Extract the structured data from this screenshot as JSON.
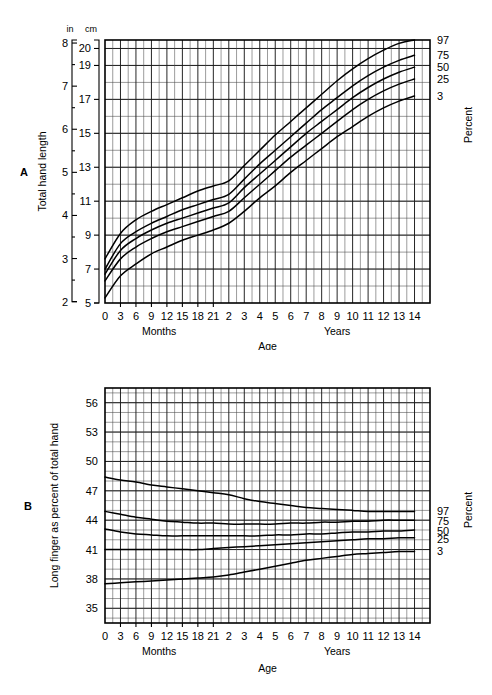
{
  "figure": {
    "panels": [
      {
        "letter": "A",
        "ylabel": "Total hand length",
        "xlabel": "Age",
        "x_group_labels": [
          "Months",
          "Years"
        ],
        "percent_label": "Percent",
        "unit_labels": [
          "in",
          "cm"
        ],
        "inch_ticks": [
          "8",
          "7",
          "6",
          "5",
          "4",
          "3",
          "2"
        ],
        "cm_ticks": [
          "20",
          "19",
          "17",
          "15",
          "13",
          "11",
          "9",
          "7",
          "5"
        ],
        "x_ticks": [
          "0",
          "3",
          "6",
          "9",
          "12",
          "15",
          "18",
          "21",
          "2",
          "3",
          "4",
          "5",
          "6",
          "7",
          "8",
          "9",
          "10",
          "11",
          "12",
          "13",
          "14"
        ],
        "percentiles": [
          "97",
          "75",
          "50",
          "25",
          "3"
        ]
      },
      {
        "letter": "B",
        "ylabel": "Long finger as percent of total hand",
        "xlabel": "Age",
        "x_group_labels": [
          "Months",
          "Years"
        ],
        "percent_label": "Percent",
        "y_ticks": [
          "56",
          "53",
          "50",
          "47",
          "44",
          "41",
          "38",
          "35"
        ],
        "x_ticks": [
          "0",
          "3",
          "6",
          "9",
          "12",
          "15",
          "18",
          "21",
          "2",
          "3",
          "4",
          "5",
          "6",
          "7",
          "8",
          "9",
          "10",
          "11",
          "12",
          "13",
          "14"
        ],
        "percentiles": [
          "97",
          "75",
          "50",
          "25",
          "3"
        ]
      }
    ]
  },
  "chart_data": [
    {
      "type": "line",
      "title": "A. Total hand length",
      "xlabel": "Age",
      "ylabel": "Total hand length",
      "y_unit_primary": "in",
      "y_unit_secondary": "cm",
      "ylim_cm": [
        5,
        20.5
      ],
      "ylim_in": [
        2,
        8.07
      ],
      "grid": true,
      "legend_position": "right",
      "x": [
        0,
        0.25,
        0.5,
        0.75,
        1,
        1.25,
        1.5,
        1.75,
        2,
        3,
        4,
        5,
        6,
        7,
        8,
        9,
        10,
        11,
        12,
        13,
        14
      ],
      "x_tick_labels": [
        "0",
        "3",
        "6",
        "9",
        "12",
        "15",
        "18",
        "21",
        "2",
        "3",
        "4",
        "5",
        "6",
        "7",
        "8",
        "9",
        "10",
        "11",
        "12",
        "13",
        "14"
      ],
      "x_units_note": "0-21 in months, 2-14 in years",
      "series": [
        {
          "name": "97",
          "values_cm": [
            7.6,
            9.1,
            9.9,
            10.4,
            10.8,
            11.2,
            11.6,
            11.9,
            12.2,
            13.1,
            14.0,
            14.9,
            15.7,
            16.5,
            17.3,
            18.1,
            18.8,
            19.4,
            19.9,
            20.3,
            20.5
          ]
        },
        {
          "name": "75",
          "values_cm": [
            7.0,
            8.5,
            9.2,
            9.7,
            10.1,
            10.5,
            10.8,
            11.1,
            11.4,
            12.3,
            13.2,
            14.0,
            14.8,
            15.6,
            16.4,
            17.1,
            17.8,
            18.4,
            18.9,
            19.3,
            19.6
          ]
        },
        {
          "name": "50",
          "values_cm": [
            6.7,
            8.1,
            8.8,
            9.3,
            9.7,
            10.0,
            10.3,
            10.6,
            10.9,
            11.8,
            12.6,
            13.4,
            14.2,
            15.0,
            15.7,
            16.4,
            17.1,
            17.7,
            18.2,
            18.6,
            18.9
          ]
        },
        {
          "name": "25",
          "values_cm": [
            6.3,
            7.6,
            8.3,
            8.8,
            9.2,
            9.5,
            9.8,
            10.1,
            10.4,
            11.2,
            12.0,
            12.8,
            13.6,
            14.3,
            15.0,
            15.7,
            16.4,
            17.0,
            17.5,
            17.9,
            18.2
          ]
        },
        {
          "name": "3",
          "values_cm": [
            5.3,
            6.6,
            7.3,
            7.9,
            8.3,
            8.7,
            9.0,
            9.3,
            9.7,
            10.4,
            11.2,
            11.9,
            12.7,
            13.4,
            14.1,
            14.8,
            15.4,
            16.0,
            16.5,
            16.9,
            17.2
          ]
        }
      ]
    },
    {
      "type": "line",
      "title": "B. Long finger as percent of total hand",
      "xlabel": "Age",
      "ylabel": "Long finger as percent of total hand",
      "ylim": [
        33.5,
        57.5
      ],
      "grid": true,
      "legend_position": "right",
      "x": [
        0,
        0.25,
        0.5,
        0.75,
        1,
        1.25,
        1.5,
        1.75,
        2,
        3,
        4,
        5,
        6,
        7,
        8,
        9,
        10,
        11,
        12,
        13,
        14
      ],
      "x_tick_labels": [
        "0",
        "3",
        "6",
        "9",
        "12",
        "15",
        "18",
        "21",
        "2",
        "3",
        "4",
        "5",
        "6",
        "7",
        "8",
        "9",
        "10",
        "11",
        "12",
        "13",
        "14"
      ],
      "x_units_note": "0-21 in months, 2-14 in years",
      "series": [
        {
          "name": "97",
          "values": [
            48.4,
            48.1,
            47.9,
            47.6,
            47.4,
            47.2,
            47.0,
            46.8,
            46.6,
            46.2,
            45.9,
            45.7,
            45.5,
            45.3,
            45.2,
            45.1,
            45.0,
            44.9,
            44.9,
            44.9,
            44.9
          ]
        },
        {
          "name": "75",
          "values": [
            44.9,
            44.6,
            44.3,
            44.1,
            43.9,
            43.8,
            43.7,
            43.7,
            43.6,
            43.6,
            43.6,
            43.6,
            43.7,
            43.7,
            43.8,
            43.8,
            43.9,
            43.9,
            44.0,
            44.0,
            44.0
          ]
        },
        {
          "name": "50",
          "values": [
            43.1,
            42.8,
            42.6,
            42.5,
            42.4,
            42.4,
            42.4,
            42.4,
            42.4,
            42.4,
            42.4,
            42.5,
            42.5,
            42.6,
            42.6,
            42.7,
            42.8,
            42.8,
            42.9,
            42.9,
            43.0
          ]
        },
        {
          "name": "25",
          "values": [
            41.0,
            41.0,
            41.0,
            41.0,
            41.0,
            41.0,
            41.0,
            41.1,
            41.2,
            41.3,
            41.4,
            41.5,
            41.6,
            41.7,
            41.8,
            41.9,
            42.0,
            42.1,
            42.1,
            42.2,
            42.2
          ]
        },
        {
          "name": "3",
          "values": [
            37.5,
            37.6,
            37.7,
            37.8,
            37.9,
            38.0,
            38.1,
            38.2,
            38.4,
            38.7,
            39.0,
            39.3,
            39.6,
            39.9,
            40.1,
            40.3,
            40.5,
            40.6,
            40.7,
            40.8,
            40.8
          ]
        }
      ]
    }
  ]
}
